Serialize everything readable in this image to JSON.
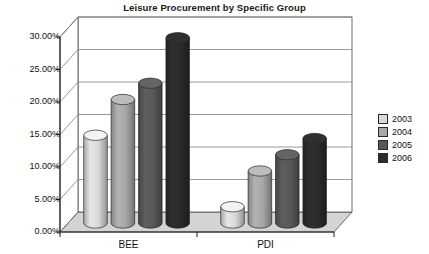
{
  "chart_data": {
    "type": "bar",
    "title": "Leisure Procurement by Specific Group",
    "xlabel": "",
    "ylabel": "",
    "categories": [
      "BEE",
      "PDI"
    ],
    "series": [
      {
        "name": "2003",
        "values": [
          13.5,
          2.5
        ],
        "color": "#d9d9d9"
      },
      {
        "name": "2004",
        "values": [
          19.0,
          8.0
        ],
        "color": "#a8a8a8"
      },
      {
        "name": "2005",
        "values": [
          21.5,
          10.5
        ],
        "color": "#595959"
      },
      {
        "name": "2006",
        "values": [
          28.5,
          13.0
        ],
        "color": "#2b2b2b"
      }
    ],
    "ylim": [
      0,
      30
    ],
    "yticks": [
      0,
      5,
      10,
      15,
      20,
      25,
      30
    ],
    "ytick_labels": [
      "0.00%",
      "5.00%",
      "10.00%",
      "15.00%",
      "20.00%",
      "25.00%",
      "30.00%"
    ],
    "grid": true,
    "legend_position": "right",
    "style": "3d-cylinder",
    "plot_background": "#ffffff",
    "floor_color": "#d4d4d4",
    "axis_color": "#4a4a4a"
  }
}
